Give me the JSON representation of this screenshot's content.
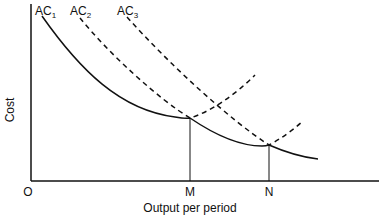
{
  "diagram": {
    "y_axis_label": "Cost",
    "x_axis_label": "Output per period",
    "origin_label": "O",
    "x_markers": [
      "M",
      "N"
    ],
    "curves": [
      {
        "name": "AC",
        "subscript": "1",
        "style": "solid"
      },
      {
        "name": "AC",
        "subscript": "2",
        "style": "dashed"
      },
      {
        "name": "AC",
        "subscript": "3",
        "style": "dashed"
      }
    ],
    "envelope": "solid"
  }
}
